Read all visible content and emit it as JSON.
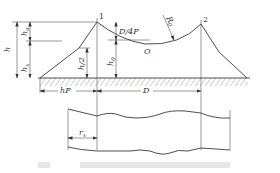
{
  "figure": {
    "type": "lightning-protection-zone diagram (two masts with catenary protection arc, elevation and plan view)",
    "elevation": {
      "peaks": [
        {
          "label": "1",
          "x": 97,
          "y": 22
        },
        {
          "label": "2",
          "x": 201,
          "y": 24
        }
      ],
      "arc_label": "O",
      "radius_label": "R",
      "radius_subscript": "0",
      "dimensions": {
        "h": "h",
        "h_s": "h",
        "h_s_sub": "a",
        "h_x": "h",
        "h_x_sub": "x",
        "h_half": "h/2",
        "d_4p": "D/4P",
        "h0": "h",
        "h0_sub": "0",
        "hp": "hP",
        "D": "D"
      }
    },
    "plan": {
      "radius_label": "r",
      "radius_subscript": "x"
    },
    "caption": ""
  },
  "colors": {
    "line": "#3a3a3a",
    "hatch": "#555555",
    "background": "#ffffff"
  }
}
